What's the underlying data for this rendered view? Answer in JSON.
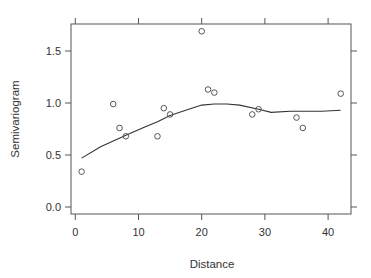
{
  "chart_data": {
    "type": "scatter",
    "title": "",
    "xlabel": "Distance",
    "ylabel": "Semivariogram",
    "xlim": [
      -1.5,
      43.5
    ],
    "ylim": [
      -0.07,
      1.78
    ],
    "x_ticks": [
      0,
      10,
      20,
      30,
      40
    ],
    "x_tick_labels": [
      "0",
      "10",
      "20",
      "30",
      "40"
    ],
    "y_ticks": [
      0.0,
      0.5,
      1.0,
      1.5
    ],
    "y_tick_labels": [
      "0.0",
      "0.5",
      "1.0",
      "1.5"
    ],
    "grid": false,
    "legend": null,
    "series": [
      {
        "name": "empirical semivariogram",
        "type": "scatter",
        "marker": "open-circle",
        "x": [
          1,
          6,
          7,
          8,
          13,
          14,
          15,
          20,
          21,
          22,
          28,
          29,
          35,
          36,
          42
        ],
        "y": [
          0.34,
          0.99,
          0.76,
          0.68,
          0.68,
          0.95,
          0.89,
          1.69,
          1.13,
          1.1,
          0.89,
          0.94,
          0.86,
          0.76,
          1.09
        ]
      },
      {
        "name": "smoothed fit",
        "type": "line",
        "x": [
          1,
          4,
          8,
          11,
          13,
          15,
          17,
          20,
          22,
          24,
          26,
          29,
          31,
          34,
          36,
          39,
          42
        ],
        "y": [
          0.47,
          0.58,
          0.69,
          0.77,
          0.82,
          0.88,
          0.92,
          0.98,
          0.99,
          0.99,
          0.98,
          0.94,
          0.91,
          0.92,
          0.92,
          0.92,
          0.93
        ]
      }
    ]
  },
  "colors": {
    "frame": "#555555",
    "points": "#555555",
    "line": "#333333"
  }
}
